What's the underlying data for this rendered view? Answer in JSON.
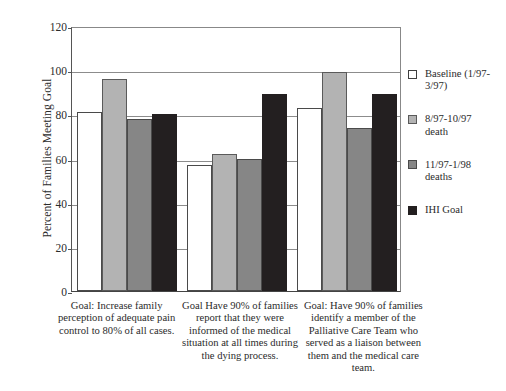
{
  "chart_data": {
    "type": "bar",
    "title": "",
    "subtitle": "",
    "xlabel": "",
    "ylabel": "Percent of Families Meeting Goal",
    "ylim": [
      0,
      120
    ],
    "ytick_values": [
      0,
      20,
      40,
      60,
      80,
      100,
      120
    ],
    "ytick_labels": [
      "0",
      "20",
      "40",
      "60",
      "80",
      "100",
      "120"
    ],
    "grid": true,
    "grid_axis": "y",
    "legend_position": "right",
    "categories": [
      "Goal: Increase family perception of adequate pain control to 80% of all cases.",
      "Goal Have 90% of families report that they were informed of the medical situation at all times during the dying process.",
      "Goal: Have 90% of families identify a member of the Palliative Care Team who served as a liaison between them and the medical care team."
    ],
    "category_lines": [
      [
        "Goal: Increase family",
        "perception of adequate pain",
        "control to 80% of all cases."
      ],
      [
        "Goal Have 90% of families",
        "report that they were",
        "informed of the medical",
        "situation at all times during",
        "the dying process."
      ],
      [
        "Goal: Have 90% of families",
        "identify a member of the",
        "Palliative Care Team who",
        "served as a liaison between",
        "them and the medical care",
        "team."
      ]
    ],
    "series": [
      {
        "name": "Baseline (1/97-3/97)",
        "color": "#ffffff",
        "swatch": "swatch-baseline",
        "values": [
          81,
          57,
          83
        ]
      },
      {
        "name": "8/97-10/97 death",
        "color": "#b3b3b3",
        "swatch": "swatch-aug97",
        "values": [
          96,
          62,
          99
        ]
      },
      {
        "name": "11/97-1/98 deaths",
        "color": "#868686",
        "swatch": "swatch-nov97",
        "values": [
          78,
          60,
          74
        ]
      },
      {
        "name": "IHI Goal",
        "color": "#231f20",
        "swatch": "swatch-ihi",
        "values": [
          80,
          89,
          89
        ]
      }
    ]
  },
  "legend": {
    "items": [
      {
        "label_lines": [
          "Baseline (1/97-",
          "3/97)"
        ],
        "swatch": "swatch-baseline"
      },
      {
        "label_lines": [
          "8/97-10/97",
          "death"
        ],
        "swatch": "swatch-aug97"
      },
      {
        "label_lines": [
          "11/97-1/98",
          "deaths"
        ],
        "swatch": "swatch-nov97"
      },
      {
        "label_lines": [
          "IHI Goal"
        ],
        "swatch": "swatch-ihi"
      }
    ]
  }
}
